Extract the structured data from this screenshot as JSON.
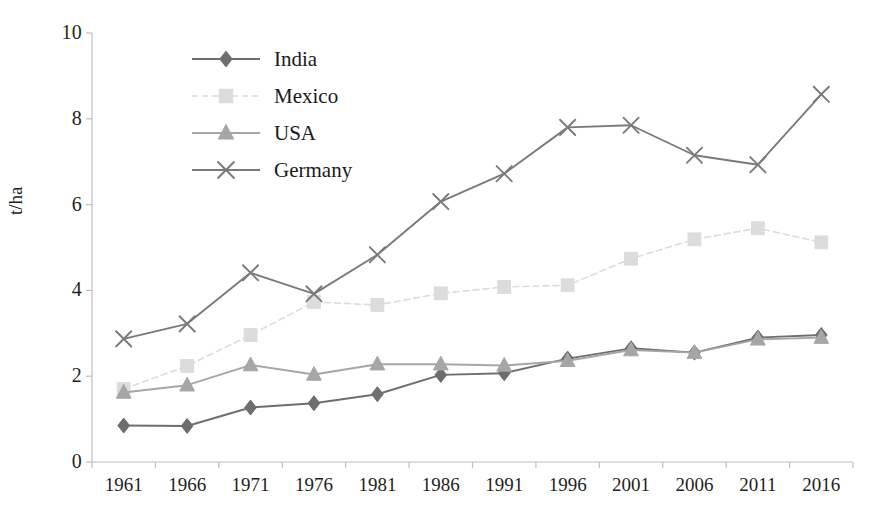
{
  "chart_data": {
    "type": "line",
    "title": "",
    "xlabel": "",
    "ylabel": "t/ha",
    "x": [
      1961,
      1966,
      1971,
      1976,
      1981,
      1986,
      1991,
      1996,
      2001,
      2006,
      2011,
      2016
    ],
    "xtick_labels": [
      "1961",
      "1966",
      "1971",
      "1976",
      "1981",
      "1986",
      "1991",
      "1996",
      "2001",
      "2006",
      "2011",
      "2016"
    ],
    "ytick_labels": [
      "0",
      "2",
      "4",
      "6",
      "8",
      "10"
    ],
    "yticks": [
      0,
      2,
      4,
      6,
      8,
      10
    ],
    "ylim": [
      0,
      10
    ],
    "grid": false,
    "legend_position": "upper-left-inside",
    "series": [
      {
        "name": "India",
        "marker": "diamond",
        "color": "#6e6e6e",
        "line_style": "solid",
        "values": [
          0.85,
          0.84,
          1.27,
          1.37,
          1.58,
          2.03,
          2.07,
          2.41,
          2.65,
          2.55,
          2.9,
          2.96
        ]
      },
      {
        "name": "Mexico",
        "marker": "square",
        "color": "#dcdcdc",
        "line_style": "dashed",
        "values": [
          1.7,
          2.24,
          2.96,
          3.73,
          3.66,
          3.93,
          4.08,
          4.12,
          4.74,
          5.19,
          5.45,
          5.12
        ]
      },
      {
        "name": "USA",
        "marker": "triangle",
        "color": "#a6a6a6",
        "line_style": "solid",
        "values": [
          1.62,
          1.79,
          2.26,
          2.04,
          2.28,
          2.28,
          2.25,
          2.36,
          2.61,
          2.55,
          2.86,
          2.9
        ]
      },
      {
        "name": "Germany",
        "marker": "x",
        "color": "#7a7a7a",
        "line_style": "solid",
        "values": [
          2.87,
          3.22,
          4.41,
          3.92,
          4.83,
          6.07,
          6.72,
          7.8,
          7.85,
          7.15,
          6.93,
          8.57
        ]
      }
    ]
  },
  "axes": {
    "y_title": "t/ha"
  },
  "legend": {
    "items": [
      {
        "label": "India"
      },
      {
        "label": "Mexico"
      },
      {
        "label": "USA"
      },
      {
        "label": "Germany"
      }
    ]
  },
  "colors": {
    "axis": "#bfbfbf",
    "text": "#231f20",
    "background": "#ffffff"
  }
}
